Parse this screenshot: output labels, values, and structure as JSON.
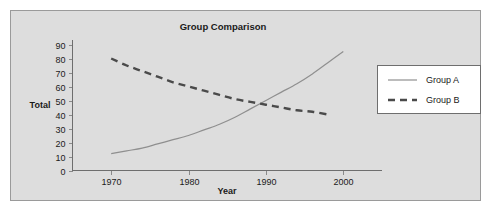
{
  "chart_data": {
    "type": "line",
    "title": "Group Comparison",
    "xlabel": "Year",
    "ylabel": "Total",
    "xlim": [
      1965,
      2005
    ],
    "ylim": [
      0,
      90
    ],
    "xticks": [
      1970,
      1980,
      1990,
      2000
    ],
    "yticks": [
      0,
      10,
      20,
      30,
      40,
      50,
      60,
      70,
      80,
      90
    ],
    "grid": false,
    "legend_position": "right",
    "series": [
      {
        "name": "Group A",
        "style": "solid",
        "color": "#8f8f8f",
        "x": [
          1970,
          1972,
          1974,
          1976,
          1978,
          1980,
          1982,
          1984,
          1986,
          1988,
          1990,
          1992,
          1994,
          1996,
          1998,
          2000
        ],
        "values": [
          12,
          14,
          16,
          19,
          22,
          25,
          29,
          33,
          38,
          44,
          50,
          56,
          62,
          69,
          77,
          85
        ]
      },
      {
        "name": "Group B",
        "style": "dashed",
        "color": "#4a4a4a",
        "x": [
          1970,
          1972,
          1974,
          1976,
          1978,
          1980,
          1982,
          1984,
          1986,
          1988,
          1990,
          1992,
          1994,
          1996,
          1998
        ],
        "values": [
          80,
          75,
          71,
          67,
          63,
          60,
          57,
          54,
          51,
          49,
          47,
          45,
          43,
          42,
          40
        ]
      }
    ]
  },
  "legend": {
    "entries": [
      {
        "label": "Group A"
      },
      {
        "label": "Group B"
      }
    ]
  }
}
